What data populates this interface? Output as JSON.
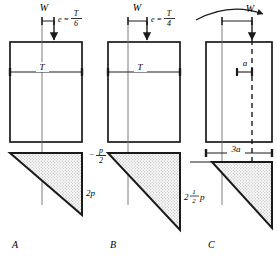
{
  "figure": {
    "ink_color": "#1a1a1a",
    "hatch_color": "#b9b9b9",
    "panels": [
      {
        "key": "A",
        "caption": "A",
        "load_label": "W",
        "eccentricity_label": "e =",
        "eccentricity_num": "T",
        "eccentricity_den": "6",
        "width_label": "T",
        "stress_right_label": "2p",
        "stress_left_label": "",
        "has_negative_stress": false,
        "has_dashed_axis": false
      },
      {
        "key": "B",
        "caption": "B",
        "load_label": "W",
        "eccentricity_label": "e =",
        "eccentricity_num": "T",
        "eccentricity_den": "4",
        "width_label": "T",
        "stress_right_whole": "2",
        "stress_right_num": "1",
        "stress_right_den": "2",
        "stress_right_unit": "p",
        "stress_left_sign": "−",
        "stress_left_num": "p",
        "stress_left_den": "2",
        "has_negative_stress": true,
        "has_dashed_axis": false
      },
      {
        "key": "C",
        "caption": "C",
        "load_label": "W",
        "dim_small_label": "a",
        "dim_large_label": "3a",
        "has_dashed_axis": true,
        "has_curved_arrow": true
      }
    ]
  }
}
